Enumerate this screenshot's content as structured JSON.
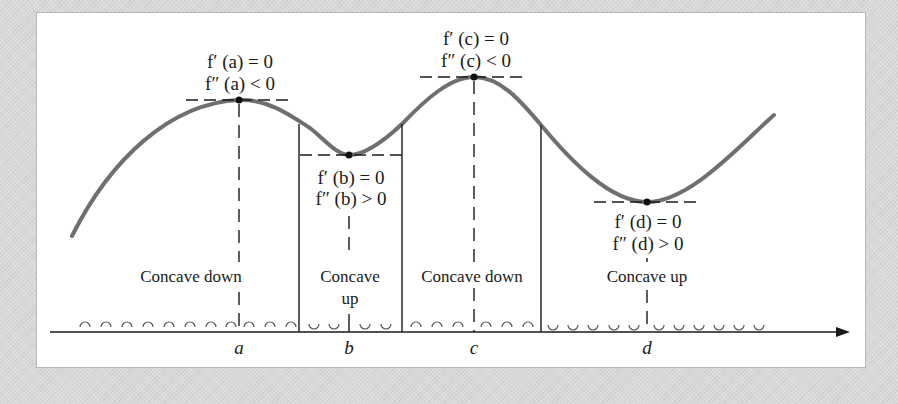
{
  "diagram": {
    "title": "",
    "points": [
      {
        "id": "a",
        "label": "a",
        "x": 239,
        "y": 100,
        "type": "local-max",
        "cond1": "f′ (a) = 0",
        "cond2": "f″ (a) < 0"
      },
      {
        "id": "b",
        "label": "b",
        "x": 349,
        "y": 155,
        "type": "local-min",
        "cond1": "f′ (b) = 0",
        "cond2": "f″ (b) > 0"
      },
      {
        "id": "c",
        "label": "c",
        "x": 474,
        "y": 77,
        "type": "local-max",
        "cond1": "f′ (c) = 0",
        "cond2": "f″ (c) < 0"
      },
      {
        "id": "d",
        "label": "d",
        "x": 647,
        "y": 202,
        "type": "local-min",
        "cond1": "f′ (d) = 0",
        "cond2": "f″ (d) > 0"
      }
    ],
    "regions": [
      {
        "id": "r1",
        "line1": "Concave down",
        "line2": "",
        "concavity": "down",
        "x0": 72,
        "x1": 299
      },
      {
        "id": "r2",
        "line1": "Concave",
        "line2": "up",
        "concavity": "up",
        "x0": 299,
        "x1": 402
      },
      {
        "id": "r3",
        "line1": "Concave down",
        "line2": "",
        "concavity": "down",
        "x0": 402,
        "x1": 541
      },
      {
        "id": "r4",
        "line1": "Concave up",
        "line2": "",
        "concavity": "up",
        "x0": 541,
        "x1": 774
      }
    ],
    "inflection_x": [
      299,
      402,
      541
    ],
    "axis": {
      "y": 332,
      "x_start": 50,
      "x_end": 850,
      "arrow": true
    },
    "colors": {
      "curve": "#6f6f6f",
      "ink": "#1a1a1a",
      "panel": "#ffffff",
      "background": "#d9d9d9"
    }
  }
}
